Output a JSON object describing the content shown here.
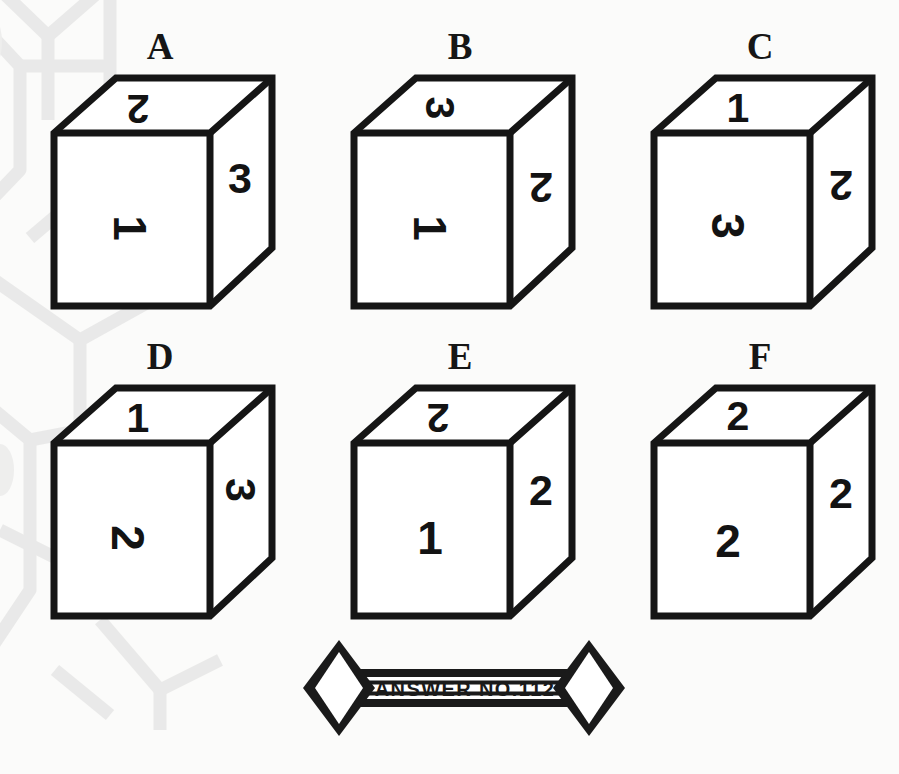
{
  "page": {
    "background_color": "#fbfbfa",
    "ink_color": "#151515",
    "watermark_color": "#d8d8d8",
    "puzzle_type": "cube-face-rotation-spatial-reasoning"
  },
  "cubes": [
    {
      "label": "A",
      "top": {
        "value": "2",
        "rotation": 180
      },
      "front": {
        "value": "1",
        "rotation": 90
      },
      "right": {
        "value": "3",
        "rotation": 0
      }
    },
    {
      "label": "B",
      "top": {
        "value": "3",
        "rotation": 90
      },
      "front": {
        "value": "1",
        "rotation": 90
      },
      "right": {
        "value": "2",
        "rotation": 180
      }
    },
    {
      "label": "C",
      "top": {
        "value": "1",
        "rotation": 0
      },
      "front": {
        "value": "3",
        "rotation": 90
      },
      "right": {
        "value": "2",
        "rotation": 180
      }
    },
    {
      "label": "D",
      "top": {
        "value": "1",
        "rotation": 0
      },
      "front": {
        "value": "2",
        "rotation": 90
      },
      "right": {
        "value": "3",
        "rotation": 90
      }
    },
    {
      "label": "E",
      "top": {
        "value": "2",
        "rotation": 180
      },
      "front": {
        "value": "1",
        "rotation": 0
      },
      "right": {
        "value": "2",
        "rotation": 0
      }
    },
    {
      "label": "F",
      "top": {
        "value": "2",
        "rotation": 0
      },
      "front": {
        "value": "2",
        "rotation": 0
      },
      "right": {
        "value": "2",
        "rotation": 0
      }
    }
  ],
  "banner": {
    "text": "ANSWER NO.112",
    "left_symbol": "?",
    "right_symbol": "?"
  }
}
